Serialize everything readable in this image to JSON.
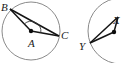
{
  "figure": {
    "canvas": {
      "width": 125,
      "height": 63,
      "background": "#ffffff"
    },
    "colors": {
      "circle_stroke": "#8a8a8a",
      "segment_stroke": "#141414",
      "arc_stroke": "#3a3a3a",
      "point_fill": "#0d0d0d",
      "label_fill": "#1a1a1a",
      "background": "#ffffff"
    },
    "diagrams": [
      {
        "id": "left-circle",
        "name": "circle-with-central-angle-bac",
        "clipped": false,
        "circle": {
          "cx": 31,
          "cy": 31,
          "r": 29
        },
        "center_point": {
          "label": "A",
          "x": 31,
          "y": 31,
          "label_x": 29,
          "label_y": 47
        },
        "points": [
          {
            "label": "B",
            "x": 10,
            "y": 9,
            "label_x": 1,
            "label_y": 9
          },
          {
            "label": "C",
            "x": 59,
            "y": 36,
            "label_x": 61,
            "label_y": 36
          }
        ],
        "segments": [
          {
            "name": "radius-ab",
            "from": "A",
            "to": "B"
          },
          {
            "name": "radius-ac",
            "from": "A",
            "to": "C"
          },
          {
            "name": "chord-bc",
            "from": "B",
            "to": "C"
          }
        ],
        "angle_marks": [
          {
            "name": "central-angle-bac",
            "at": "A",
            "radius": 10
          }
        ]
      },
      {
        "id": "right-circle",
        "name": "circle-with-central-angle-partial",
        "clipped": true,
        "circle": {
          "cx": 121,
          "cy": 31,
          "r": 33
        },
        "center_point": {
          "label": "",
          "x": 114,
          "y": 32,
          "label_x": 0,
          "label_y": 0
        },
        "points": [
          {
            "label": "Y",
            "x": 90,
            "y": 43,
            "label_x": 79,
            "label_y": 48
          },
          {
            "label": "X",
            "x": 117,
            "y": 16,
            "label_x": 112,
            "label_y": 22
          }
        ],
        "segments": [
          {
            "name": "radius-y-center",
            "from": "Y",
            "to": "center"
          },
          {
            "name": "chord-yx",
            "from": "Y",
            "to": "X"
          },
          {
            "name": "radius-x-center",
            "from": "X",
            "to": "center"
          }
        ],
        "angle_marks": []
      }
    ]
  }
}
